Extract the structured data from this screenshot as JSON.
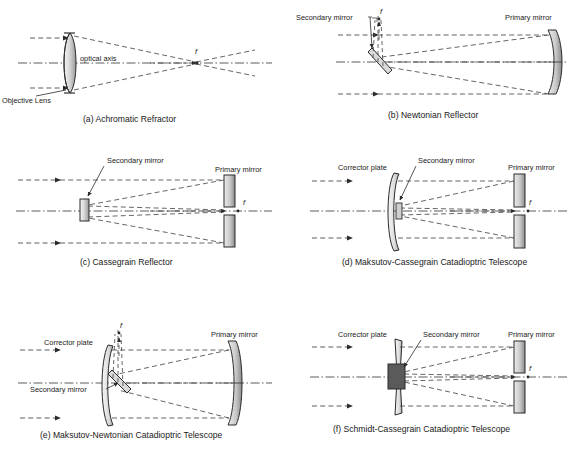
{
  "figure": {
    "background": "#ffffff",
    "ink": "#1a1a1a",
    "ray_color": "#4a4a4a",
    "axis_color": "#4a4a4a",
    "glass_fill_light": "#f2f2f2",
    "glass_fill_dark": "#8a8a8a",
    "mirror_fill_light": "#e6e6e6",
    "mirror_fill_dark": "#8c8c8c",
    "secondary_dark_fill": "#5a5a5a"
  },
  "common_labels": {
    "primary_mirror": "Primary mirror",
    "secondary_mirror": "Secondary mirror",
    "corrector_plate": "Corrector plate",
    "objective_lens": "Objective Lens",
    "optical_axis": "optical axis",
    "focus": "f"
  },
  "panels": [
    {
      "id": "a",
      "caption": "(a) Achromatic Refractor",
      "elements": [
        "objective-lens",
        "optical-axis",
        "focus-marker",
        "incoming-rays"
      ],
      "labels": [
        {
          "name": "objective-lens-label",
          "text": "Objective Lens"
        },
        {
          "name": "optical-axis-label",
          "text": "optical axis"
        },
        {
          "name": "focus-label",
          "text": "f"
        }
      ]
    },
    {
      "id": "b",
      "caption": "(b) Newtonian Reflector",
      "elements": [
        "primary-mirror",
        "diagonal-secondary-mirror",
        "focus-marker",
        "incoming-rays"
      ],
      "labels": [
        {
          "name": "secondary-mirror-label",
          "text": "Secondary mirror"
        },
        {
          "name": "primary-mirror-label",
          "text": "Primary mirror"
        },
        {
          "name": "focus-label",
          "text": "f"
        }
      ]
    },
    {
      "id": "c",
      "caption": "(c) Cassegrain Reflector",
      "elements": [
        "split-primary-mirror",
        "secondary-mirror",
        "focus-marker",
        "incoming-rays"
      ],
      "labels": [
        {
          "name": "secondary-mirror-label",
          "text": "Secondary mirror"
        },
        {
          "name": "primary-mirror-label",
          "text": "Primary mirror"
        },
        {
          "name": "focus-label",
          "text": "f"
        }
      ]
    },
    {
      "id": "d",
      "caption": "(d) Maksutov-Cassegrain Catadioptric Telescope",
      "elements": [
        "meniscus-corrector-plate",
        "split-primary-mirror",
        "secondary-mirror",
        "focus-marker",
        "incoming-rays"
      ],
      "labels": [
        {
          "name": "corrector-plate-label",
          "text": "Corrector plate"
        },
        {
          "name": "secondary-mirror-label",
          "text": "Secondary mirror"
        },
        {
          "name": "primary-mirror-label",
          "text": "Primary mirror"
        },
        {
          "name": "focus-label",
          "text": "f"
        }
      ]
    },
    {
      "id": "e",
      "caption": "(e) Maksutov-Newtonian Catadioptric Telescope",
      "elements": [
        "meniscus-corrector-plate",
        "primary-mirror",
        "diagonal-secondary-mirror",
        "focus-marker",
        "incoming-rays"
      ],
      "labels": [
        {
          "name": "corrector-plate-label",
          "text": "Corrector plate"
        },
        {
          "name": "secondary-mirror-label",
          "text": "Secondary mirror"
        },
        {
          "name": "primary-mirror-label",
          "text": "Primary mirror"
        },
        {
          "name": "focus-label",
          "text": "f"
        }
      ]
    },
    {
      "id": "f",
      "caption": "(f) Schmidt-Cassegrain Catadioptric Telescope",
      "elements": [
        "schmidt-corrector-plate",
        "split-primary-mirror",
        "secondary-mirror-block",
        "focus-marker",
        "incoming-rays"
      ],
      "labels": [
        {
          "name": "corrector-plate-label",
          "text": "Corrector plate"
        },
        {
          "name": "secondary-mirror-label",
          "text": "Secondary mirror"
        },
        {
          "name": "primary-mirror-label",
          "text": "Primary mirror"
        },
        {
          "name": "focus-label",
          "text": "f"
        }
      ]
    }
  ]
}
